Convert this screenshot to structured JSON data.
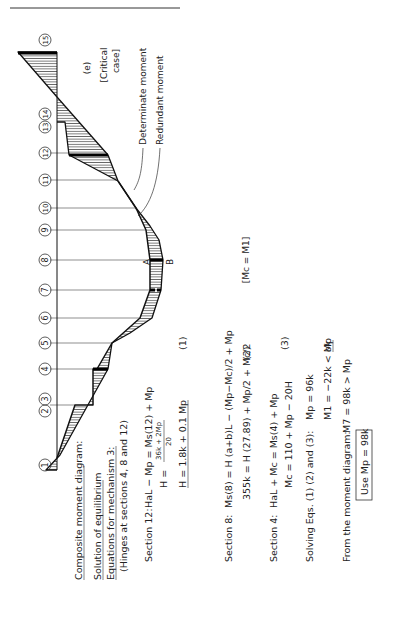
{
  "figure": {
    "panel_label": "(e)",
    "critical_case_line1": "[Critical",
    "critical_case_line2": "case]",
    "legend_determinate": "Determinate moment",
    "legend_redundant": "Redundant moment",
    "point_a": "A",
    "point_b": "B",
    "mc_eq_m1": "[Mc = M1]",
    "sections": [
      "1",
      "2",
      "3",
      "4",
      "5",
      "6",
      "7",
      "8",
      "9",
      "10",
      "11",
      "12",
      "13",
      "14",
      "15"
    ]
  },
  "text": {
    "heading": "Composite moment diagram:",
    "solution_heading": "Solution of equilibrium",
    "equations_heading": "Equations for mechanism 3:",
    "hinges_note": "(Hinges at sections 4, 8 and 12)",
    "sec12_label": "Section 12:",
    "sec12_eq": "HaL − Mp = Ms(12) + Mp",
    "sec12_h_frac_num": "36k + 2Mp",
    "sec12_h_frac_den": "20",
    "sec12_h_lhs": "H  =",
    "sec12_h_result": "H  = 1.8k + 0.1 Mp",
    "eq1_tag": "(1)",
    "sec8_label": "Section 8:",
    "sec8_eq": "Ms(8) = H (a+b)L − (Mp−Mc)/2 + Mp",
    "sec8_eq2": "355k = H (27.89) + Mp/2 + Mc/2",
    "eq2_tag": "(2)",
    "sec4_label": "Section 4:",
    "sec4_eq": "HaL + Mc = Ms(4) + Mp",
    "sec4_eq2": "Mc = 110 + Mp − 20H",
    "eq3_tag": "(3)",
    "solving_label": "Solving Eqs. (1) (2) and (3):",
    "solve_mp": "Mp = 96k",
    "solve_m1": "M1 = −22k < Mp",
    "ok_mark": "ok",
    "from_diagram": "From the moment diagram:",
    "from_diagram_eq": "M7 = 98k > Mp",
    "use_box": "Use Mp = 98k"
  }
}
